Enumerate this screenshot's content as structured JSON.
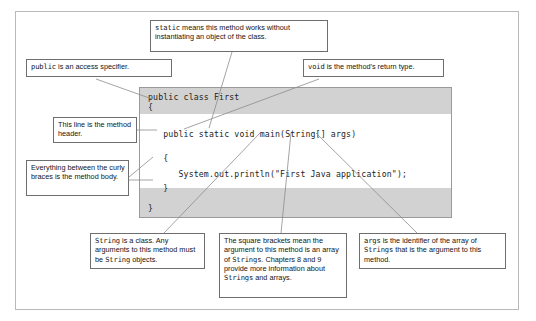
{
  "figure": {
    "frame_color": "#b9b9b9",
    "background_color": "#ffffff",
    "callout_border_color": "#6e6e6e",
    "code_band_color": "#d2d2d2",
    "code_border_color": "#9a9a9a",
    "leader_line_color": "#8d8d8d"
  },
  "code": {
    "lines": [
      {
        "text": "public class First",
        "shaded": true
      },
      {
        "text": "{",
        "shaded": true
      },
      {
        "text": "",
        "shaded": false
      },
      {
        "text": "   public static void main(String[] args)",
        "shaded": false
      },
      {
        "text": "",
        "shaded": false
      },
      {
        "text": "   {",
        "shaded": false
      },
      {
        "text": "      System.out.println(\"First Java application\");",
        "shaded": false
      },
      {
        "text": "   }",
        "shaded": false
      },
      {
        "text": "",
        "shaded": true
      },
      {
        "text": "}",
        "shaded": true
      }
    ],
    "full_text": "public class First\n{\n\n   public static void main(String[] args)\n\n   {\n      System.out.println(\"First Java application\");\n   }\n\n}"
  },
  "callouts": [
    {
      "id": "static-callout",
      "name": "callout-static",
      "keyword": "static",
      "text_after": " means this method works without instantiating an object of the class.",
      "full_text": "static means this method works without instantiating an object of the class."
    },
    {
      "id": "public-callout",
      "name": "callout-public",
      "keyword": "public",
      "text_after": " is an access specifier.",
      "full_text": "public is an access specifier."
    },
    {
      "id": "void-callout",
      "name": "callout-void",
      "keyword": "void",
      "text_after": " is the method's return type.",
      "full_text": "void is the method's return type."
    },
    {
      "id": "method-header-callout",
      "name": "callout-method-header",
      "full_text": "This line is the method header."
    },
    {
      "id": "method-body-callout",
      "name": "callout-method-body",
      "full_text": "Everything between the curly braces is the method body."
    },
    {
      "id": "string-class-callout",
      "name": "callout-string-class",
      "full_text": "String is a class. Any arguments to this method must be String objects."
    },
    {
      "id": "brackets-callout",
      "name": "callout-square-brackets",
      "full_text": "The square brackets mean the argument to this method is an array of Strings. Chapters 8 and 9 provide more information about Strings and arrays."
    },
    {
      "id": "args-callout",
      "name": "callout-args-identifier",
      "full_text": "args is the identifier of the array of Strings that is the argument to this method."
    }
  ],
  "text": {
    "static_kw": "static",
    "static_rest": " means this method works without instantiating an object of the class.",
    "public_kw": "public",
    "public_rest": " is an access specifier.",
    "void_kw": "void",
    "void_rest": " is the method's return type.",
    "method_header": "This line is the method header.",
    "method_body": "Everything between the curly braces is the method body.",
    "string_kw1": "String",
    "string_mid": " is a class. Any arguments to this method must be ",
    "string_kw2": "String",
    "string_end": " objects.",
    "brackets_a": "The square brackets mean the argument to this method is an array of ",
    "brackets_kw1": "Strings",
    "brackets_b": ". Chapters 8 and 9 provide more information about ",
    "brackets_kw2": "Strings",
    "brackets_c": " and arrays.",
    "args_kw": "args",
    "args_a": " is the identifier of the array of ",
    "args_kw2": "Strings",
    "args_b": " that is the argument to this method."
  },
  "code_lines": {
    "l0": "public class First",
    "l1": "{",
    "l2": "   public static void main(String[] args)",
    "l3": "   {",
    "l4": "      System.out.println(\"First Java application\");",
    "l5": "   }",
    "l6": "}"
  }
}
